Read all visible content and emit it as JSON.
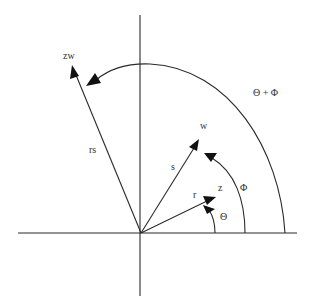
{
  "diagram": {
    "origin": {
      "x": 141,
      "y": 233
    },
    "colors": {
      "line": "#2a2a2a",
      "text": "#333333",
      "background": "#ffffff"
    },
    "vectors": [
      {
        "name": "z",
        "tip_label": "z",
        "length_label": "r",
        "tip": [
          214,
          198
        ]
      },
      {
        "name": "w",
        "tip_label": "w",
        "length_label": "s",
        "tip": [
          198,
          141
        ]
      },
      {
        "name": "zw",
        "tip_label": "zw",
        "length_label": "rs",
        "tip": [
          72,
          66
        ]
      }
    ],
    "angles": [
      {
        "name": "theta",
        "label": "Θ"
      },
      {
        "name": "phi",
        "label": "Φ"
      },
      {
        "name": "theta-plus-phi",
        "label": "Θ + Φ"
      }
    ]
  }
}
